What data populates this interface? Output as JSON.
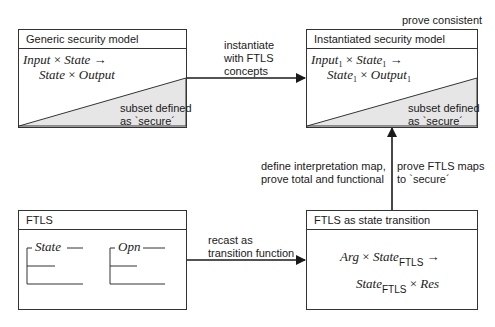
{
  "boxes": {
    "generic": {
      "title": "Generic security model",
      "formula_line1": {
        "a": "Input",
        "x1": "×",
        "b": "State",
        "arrow": "→"
      },
      "formula_line2": {
        "a": "State",
        "x1": "×",
        "b": "Output"
      },
      "subset_label_line1": "subset defined",
      "subset_label_line2": "as `secure´"
    },
    "instantiated": {
      "title": "Instantiated security model",
      "formula_line1": {
        "a": "Input",
        "a_sub": "1",
        "x1": "×",
        "b": "State",
        "b_sub": "1",
        "arrow": "→"
      },
      "formula_line2": {
        "a": "State",
        "a_sub": "1",
        "x1": "×",
        "b": "Output",
        "b_sub": "1"
      },
      "subset_label_line1": "subset defined",
      "subset_label_line2": "as `secure´",
      "top_label": "prove consistent"
    },
    "ftls": {
      "title": "FTLS",
      "schemas": [
        {
          "name": "State"
        },
        {
          "name": "Opn"
        }
      ]
    },
    "ftls_transition": {
      "title": "FTLS as state transition",
      "formula_line1": {
        "a": "Arg",
        "x1": "×",
        "b": "State",
        "b_sub": "FTLS",
        "arrow": "→"
      },
      "formula_line2": {
        "a": "State",
        "a_sub": "FTLS",
        "x1": "×",
        "b": "Res"
      }
    }
  },
  "arrows": {
    "instantiate": {
      "line1": "instantiate",
      "line2": "with FTLS",
      "line3": "concepts"
    },
    "recast": {
      "line1": "recast as",
      "line2": "transition function"
    },
    "interpretation": {
      "line1": "define interpretation map,",
      "line2": "prove total and functional"
    },
    "prove_maps": {
      "line1": "prove FTLS maps",
      "line2": "to `secure´"
    }
  },
  "colors": {
    "line": "#1a1a1a",
    "shade": "#e6e6e6",
    "border": "#333333"
  }
}
